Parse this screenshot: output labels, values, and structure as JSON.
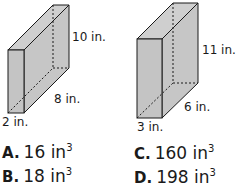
{
  "figures": [
    {
      "id": "prism-1",
      "height_label": "10 in.",
      "length_label": "8 in.",
      "width_label": "2 in."
    },
    {
      "id": "prism-2",
      "height_label": "11 in.",
      "length_label": "6 in.",
      "width_label": "3 in."
    }
  ],
  "choices": [
    {
      "letter": "A.",
      "value": "16 in",
      "exp": "3"
    },
    {
      "letter": "B.",
      "value": "18 in",
      "exp": "3"
    },
    {
      "letter": "C.",
      "value": "160 in",
      "exp": "3"
    },
    {
      "letter": "D.",
      "value": "198 in",
      "exp": "3"
    }
  ],
  "colors": {
    "face_fill": "#c8c8c8",
    "front_fill": "#c4c4c4",
    "stroke": "#1a1a1a"
  }
}
